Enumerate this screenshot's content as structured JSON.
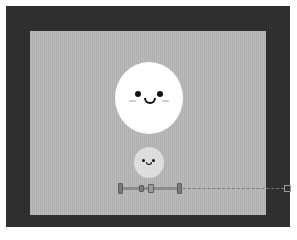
{
  "scene": {
    "background_frame_color": "#2e2e2e",
    "stage_color": "#b4b4b4",
    "characters": [
      {
        "name": "big-smiley",
        "color": "#ffffff",
        "expression": "smile"
      },
      {
        "name": "small-smiley",
        "color": "#ffffff",
        "opacity": 0.55,
        "expression": "smile"
      }
    ]
  },
  "controls": {
    "slider": {
      "handles": [
        "left-handle",
        "mid-handle",
        "center-knob",
        "right-handle"
      ],
      "end_marker": "end-box"
    }
  }
}
